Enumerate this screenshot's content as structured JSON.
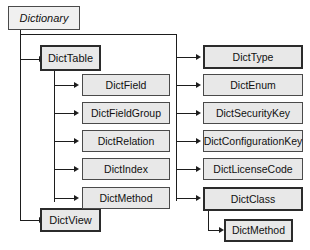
{
  "diagram": {
    "type": "tree-diagram",
    "colors": {
      "node_fill": "#e8e8e8",
      "root_fill": "#f0f0f0",
      "border": "#4a4a4a",
      "border_emphasis": "#2b2b2b",
      "line": "#1d1d1d",
      "text": "#111111",
      "background": "#ffffff"
    },
    "nodes": {
      "root": {
        "label": "Dictionary",
        "style": "italic"
      },
      "dict_table": {
        "label": "DictTable"
      },
      "dict_view": {
        "label": "DictView"
      },
      "dict_field": {
        "label": "DictField"
      },
      "dict_field_group": {
        "label": "DictFieldGroup"
      },
      "dict_relation": {
        "label": "DictRelation"
      },
      "dict_index": {
        "label": "DictIndex"
      },
      "dict_method_table": {
        "label": "DictMethod"
      },
      "dict_type": {
        "label": "DictType"
      },
      "dict_enum": {
        "label": "DictEnum"
      },
      "dict_security_key": {
        "label": "DictSecurityKey"
      },
      "dict_configuration_key": {
        "label": "DictConfigurationKey"
      },
      "dict_license_code": {
        "label": "DictLicenseCode"
      },
      "dict_class": {
        "label": "DictClass"
      },
      "dict_method_class": {
        "label": "DictMethod"
      }
    }
  }
}
